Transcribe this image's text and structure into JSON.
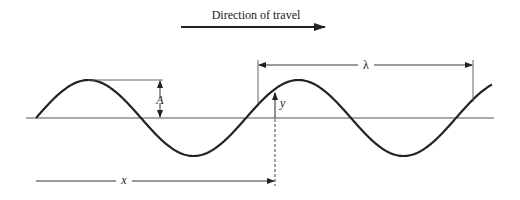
{
  "title": "Direction of travel",
  "labels": {
    "amplitude": "A",
    "displacement": "y",
    "wavelength": "λ",
    "position": "x"
  },
  "colors": {
    "ink": "#222222",
    "axis": "#555555",
    "background": "#ffffff"
  },
  "wave": {
    "description": "Transverse sinusoidal wave travelling to the right",
    "cycles_shown": 2.2
  }
}
